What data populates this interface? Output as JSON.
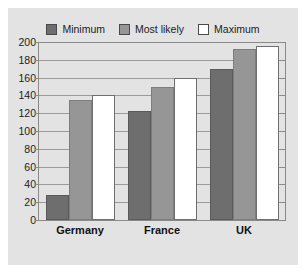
{
  "chart_data": {
    "type": "bar",
    "title": "",
    "xlabel": "",
    "ylabel": "",
    "categories": [
      "Germany",
      "France",
      "UK"
    ],
    "series": [
      {
        "name": "Minimum",
        "color": "#6e6e6e",
        "values": [
          28,
          123,
          170
        ]
      },
      {
        "name": "Most likely",
        "color": "#969696",
        "values": [
          135,
          150,
          192
        ]
      },
      {
        "name": "Maximum",
        "color": "#ffffff",
        "values": [
          140,
          160,
          195
        ]
      }
    ],
    "ylim": [
      0,
      200
    ],
    "ytick_step": 20,
    "yticks": [
      0,
      20,
      40,
      60,
      80,
      100,
      120,
      140,
      160,
      180,
      200
    ],
    "ytick_labels": [
      "0",
      "20",
      "40",
      "60",
      "80",
      "100",
      "120",
      "140",
      "160",
      "180",
      "200"
    ],
    "grid": true,
    "grid_axis": "y",
    "legend_position": "top",
    "legend": [
      "Minimum",
      "Most likely",
      "Maximum"
    ]
  },
  "legend": {
    "items": [
      {
        "label": "Minimum",
        "swatch": "#6e6e6e"
      },
      {
        "label": "Most likely",
        "swatch": "#969696"
      },
      {
        "label": "Maximum",
        "swatch": "#ffffff"
      }
    ]
  },
  "colors": {
    "panel_background": "#e3e3e3",
    "gridline": "#9a9a9a",
    "axis": "#8a8a8a",
    "text": "#1c1c1c",
    "minimum": "#6e6e6e",
    "most_likely": "#969696",
    "maximum": "#ffffff"
  }
}
